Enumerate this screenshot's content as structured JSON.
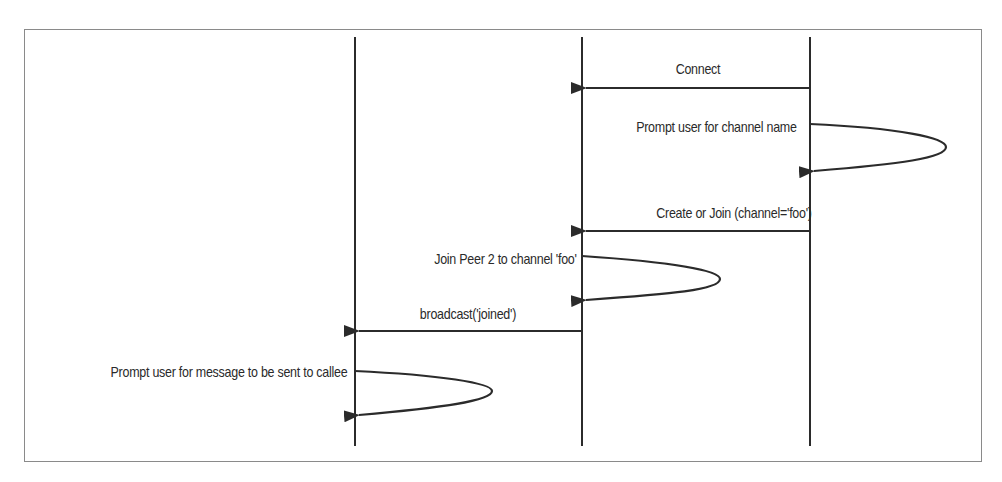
{
  "diagram": {
    "type": "sequence",
    "lifelines": [
      {
        "id": "L1",
        "x": 355
      },
      {
        "id": "L2",
        "x": 582
      },
      {
        "id": "L3",
        "x": 810
      }
    ],
    "messages": [
      {
        "label": "Connect",
        "from": "L3",
        "to": "L2",
        "y": 88,
        "kind": "arrow"
      },
      {
        "label": "Prompt user for channel name",
        "on": "L3",
        "y1": 124,
        "y2": 170,
        "kind": "self"
      },
      {
        "label": "Create or Join (channel='foo')",
        "from": "L3",
        "to": "L2",
        "y": 231,
        "kind": "arrow"
      },
      {
        "label": "Join Peer 2 to channel 'foo'",
        "on": "L2",
        "y1": 256,
        "y2": 300,
        "kind": "self"
      },
      {
        "label": "broadcast('joined')",
        "from": "L2",
        "to": "L1",
        "y": 331,
        "kind": "arrow"
      },
      {
        "label": "Prompt user for message to be sent to callee",
        "on": "L1",
        "y1": 371,
        "y2": 415,
        "kind": "self"
      }
    ],
    "colors": {
      "line": "#2b2b2b",
      "frame": "#8a8a8a",
      "text": "#2a2a2a"
    }
  }
}
